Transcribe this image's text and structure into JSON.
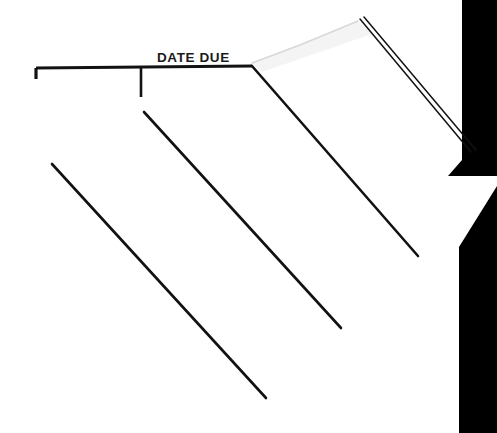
{
  "document": {
    "kind": "library-date-due-slip-scan",
    "heading": "DATE DUE",
    "page_width": 497,
    "page_height": 433
  },
  "colors": {
    "paper": "#ffffff",
    "ink": "#121212",
    "background_black": "#000000",
    "paper_edge_gray": "#d8d8d8",
    "faint_shadow": "#efefef"
  },
  "heading_block": {
    "label": "DATE DUE",
    "text_x": 157,
    "text_baseline_y": 62,
    "font_size_px": 13.5,
    "bold": true
  },
  "rules": {
    "top_rule": {
      "name": "top-horizontal-rule",
      "x1": 36,
      "y1": 68,
      "x2": 252,
      "y2": 66,
      "stroke_width": 3.2
    },
    "left_end_tick": {
      "name": "left-end-tick",
      "x1": 36,
      "y1": 68,
      "x2": 36,
      "y2": 79,
      "stroke_width": 3.2
    },
    "center_tick": {
      "name": "center-vertical-tick",
      "x1": 141,
      "y1": 67,
      "x2": 141,
      "y2": 97,
      "stroke_width": 2.6
    }
  },
  "diagonal_rules": [
    {
      "name": "diagonal-rule-1",
      "x1": 52,
      "y1": 164,
      "x2": 266,
      "y2": 398,
      "stroke_width": 2.6
    },
    {
      "name": "diagonal-rule-2",
      "x1": 144,
      "y1": 112,
      "x2": 341,
      "y2": 328,
      "stroke_width": 2.6
    },
    {
      "name": "diagonal-rule-3",
      "x1": 252,
      "y1": 66,
      "x2": 418,
      "y2": 256,
      "stroke_width": 2.6
    }
  ],
  "page_edge": {
    "name": "upper-page-edge",
    "points": "252,63 300,45 358,21",
    "stroke_width": 1.6,
    "description": "faint light-gray lifted top edge of the slip"
  },
  "spine_lines": {
    "name": "spine-double-line",
    "line_a": {
      "x1": 360,
      "y1": 19,
      "x2": 471,
      "y2": 152
    },
    "line_b": {
      "x1": 364,
      "y1": 17,
      "x2": 476,
      "y2": 150
    },
    "stroke_width": 1.5,
    "description": "dark double rule along the lifted binding edge"
  },
  "background_shape": {
    "name": "black-background-region",
    "polygon": "462,0 497,0 497,433 459,433 459,247 497,186 497,176 448,176 462,160",
    "fill": "#000000",
    "description": "black area to the right of the slip, notched by the white page corner"
  },
  "annotations": {
    "alt_text": "Scanned DATE DUE slip pasted inside a book cover, photographed at an angle with black background at right."
  }
}
